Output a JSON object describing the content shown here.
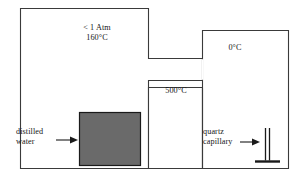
{
  "diagram": {
    "background_color": "#ffffff",
    "outline_color": "#3a3a3a",
    "water_fill_color": "#6a6a6a",
    "labels": {
      "pressure_line1": "< 1 Atm",
      "pressure_line2": "160°C",
      "cold_zone": "0°C",
      "hot_zone": "500°C",
      "water_line1": "distilled",
      "water_line2": "water",
      "capillary_line1": "quartz",
      "capillary_line2": "capillary"
    },
    "regions": [
      {
        "name": "left-chamber",
        "label": "< 1 Atm / 160°C",
        "x": 20,
        "y": 8,
        "width": 128,
        "height": 160
      },
      {
        "name": "hot-chamber",
        "label": "500°C",
        "x": 148,
        "y": 87,
        "width": 54,
        "height": 81
      },
      {
        "name": "right-chamber",
        "label": "0°C",
        "x": 202,
        "y": 30,
        "width": 86,
        "height": 138
      }
    ],
    "components": [
      {
        "name": "distilled-water-block",
        "x": 79,
        "y": 112,
        "width": 61,
        "height": 53,
        "fill": "#6a6a6a"
      },
      {
        "name": "quartz-capillary",
        "x": 265,
        "y": 128,
        "height": 34
      }
    ],
    "icons": {
      "water_arrow": "arrow-right-icon",
      "capillary_arrow": "arrow-right-icon"
    }
  }
}
